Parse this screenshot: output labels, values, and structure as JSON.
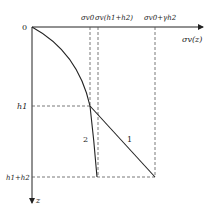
{
  "diagram": {
    "origin_label": "0",
    "x_axis_label": "σv(z)",
    "z_axis_label": "z",
    "top_labels": {
      "sigma_v0": "σv0",
      "sigma_v_h1h2": "σv(h1+h2)",
      "sigma_v0_plus": "σv0+γh2"
    },
    "depth_labels": {
      "h1": "h1",
      "h1_h2": "h1+h2"
    },
    "curve_labels": {
      "curve1": "1",
      "curve2": "2"
    },
    "colors": {
      "line": "#222222",
      "dashed": "#555555"
    }
  }
}
